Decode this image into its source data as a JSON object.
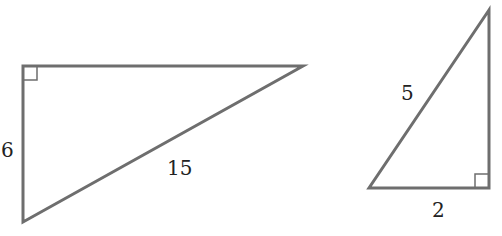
{
  "diagram": {
    "stroke_color": "#6e6e6e",
    "label_color": "#222222",
    "triangles": [
      {
        "name": "left-right-triangle",
        "vertices": [
          [
            23,
            66
          ],
          [
            303,
            66
          ],
          [
            23,
            222
          ]
        ],
        "right_angle_at": [
          23,
          66
        ],
        "labels": [
          {
            "side": "vertical-leg",
            "text": "6",
            "x": 1,
            "y": 150
          },
          {
            "side": "hypotenuse",
            "text": "15",
            "x": 167,
            "y": 168
          }
        ]
      },
      {
        "name": "right-right-triangle",
        "vertices": [
          [
            489,
            10
          ],
          [
            369,
            188
          ],
          [
            489,
            188
          ]
        ],
        "right_angle_at": [
          489,
          188
        ],
        "labels": [
          {
            "side": "hypotenuse",
            "text": "5",
            "x": 401,
            "y": 100
          },
          {
            "side": "bottom-leg",
            "text": "2",
            "x": 432,
            "y": 217
          }
        ]
      }
    ]
  }
}
